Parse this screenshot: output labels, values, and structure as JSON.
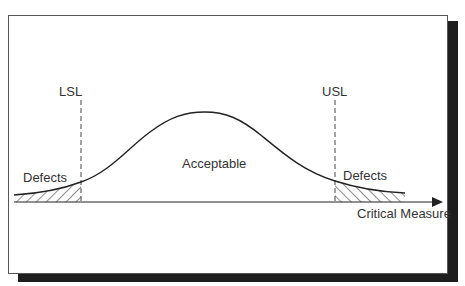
{
  "diagram": {
    "labels": {
      "lsl": "LSL",
      "usl": "USL",
      "acceptable": "Acceptable",
      "defects_left": "Defects",
      "defects_right": "Defects",
      "x_axis": "Critical Measure"
    },
    "colors": {
      "line": "#222222",
      "text": "#333333",
      "frame_border": "#555555",
      "shadow": "#1e1e1e",
      "background": "#ffffff"
    },
    "elements": {
      "curve": "normal-distribution-bell-curve",
      "lsl_line": "dashed-vertical-line",
      "usl_line": "dashed-vertical-line",
      "defect_regions": "hatched-tails",
      "axis": "horizontal-arrow"
    }
  }
}
